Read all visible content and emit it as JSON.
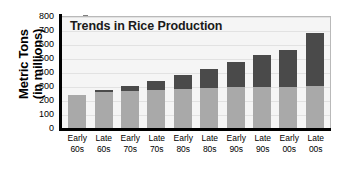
{
  "chart_data": {
    "type": "bar",
    "title": "Trends in Rice Production",
    "xlabel": "",
    "ylabel": "Metric Tons",
    "ylabel_line2": "(in millions)",
    "ylim": [
      0,
      800
    ],
    "yticks": [
      0,
      100,
      200,
      300,
      400,
      500,
      600,
      700,
      800
    ],
    "grid": true,
    "legend_position": "none",
    "stacked": true,
    "categories": [
      "Early 60s",
      "Late 60s",
      "Early 70s",
      "Late 70s",
      "Early 80s",
      "Late 80s",
      "Early 90s",
      "Late 90s",
      "Early 00s",
      "Late 00s"
    ],
    "category_lines": [
      [
        "Early",
        "60s"
      ],
      [
        "Late",
        "60s"
      ],
      [
        "Early",
        "70s"
      ],
      [
        "Late",
        "70s"
      ],
      [
        "Early",
        "80s"
      ],
      [
        "Late",
        "80s"
      ],
      [
        "Early",
        "90s"
      ],
      [
        "Late",
        "90s"
      ],
      [
        "Early",
        "00s"
      ],
      [
        "Late",
        "00s"
      ]
    ],
    "series": [
      {
        "name": "lower-segment",
        "color": "#a9a9a9",
        "values": [
          235,
          255,
          265,
          275,
          280,
          285,
          290,
          295,
          295,
          300
        ]
      },
      {
        "name": "upper-segment",
        "color": "#4a4a4a",
        "values": [
          0,
          20,
          35,
          60,
          100,
          140,
          185,
          225,
          260,
          380
        ]
      }
    ],
    "totals": [
      235,
      275,
      300,
      335,
      380,
      425,
      475,
      520,
      555,
      680
    ]
  },
  "colors": {
    "bar_lower": "#a9a9a9",
    "bar_upper": "#4a4a4a",
    "plot_background": "#f5f5f5",
    "axis": "#000000",
    "gridline": "#e2e2e2",
    "plot_border": "#b9b9b9",
    "page_background": "#ffffff"
  }
}
